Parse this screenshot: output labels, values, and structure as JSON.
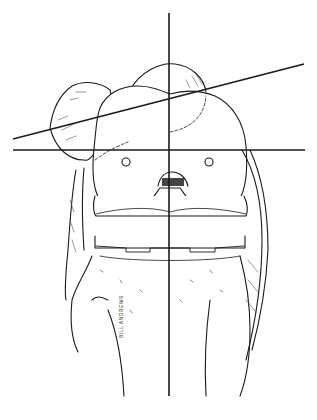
{
  "figure": {
    "signature": "BILL ANDREWS",
    "colors": {
      "ink": "#1a1a1a",
      "background": "#ffffff",
      "shade": "#555555"
    },
    "reference_lines": {
      "vertical": {
        "x": 169,
        "y1": 13,
        "y2": 396
      },
      "horizontal": {
        "y": 150,
        "x1": 13,
        "x2": 305
      },
      "oblique": {
        "x1": 13,
        "y1": 139,
        "x2": 304,
        "y2": 64
      }
    }
  }
}
